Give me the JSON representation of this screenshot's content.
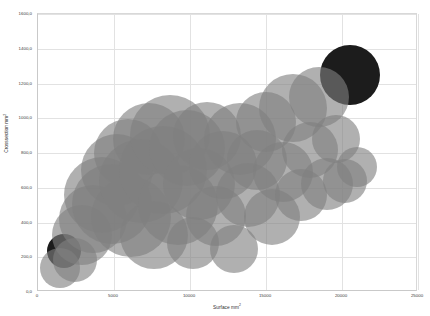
{
  "chart_data": {
    "type": "scatter",
    "variant": "bubble",
    "title": "",
    "xlabel": "Surface mm²",
    "ylabel": "Crosssection mm²",
    "xlim": [
      0,
      25000
    ],
    "ylim": [
      0,
      1600
    ],
    "xticks": [
      0,
      5000,
      10000,
      15000,
      20000,
      25000
    ],
    "xtick_labels": [
      "0",
      "5000",
      "10000",
      "15000",
      "20000",
      "25000"
    ],
    "yticks": [
      0,
      200,
      400,
      600,
      800,
      1000,
      1200,
      1400,
      1600
    ],
    "ytick_labels": [
      "0,0",
      "200,0",
      "400,0",
      "600,0",
      "800,0",
      "1000,0",
      "1200,0",
      "1400,0",
      "1600,0"
    ],
    "grid": true,
    "legend": "none",
    "bubble_color": "#808080",
    "bubble_opacity": 0.62,
    "highlight_color": "#1c1c1c",
    "background": "#ffffff",
    "grid_color": "#e2e2e2",
    "points": [
      {
        "x": 1700,
        "y": 235,
        "r": 17,
        "highlight": true
      },
      {
        "x": 20500,
        "y": 1250,
        "r": 30,
        "highlight": true
      },
      {
        "x": 1450,
        "y": 140,
        "r": 20,
        "highlight": false
      },
      {
        "x": 2450,
        "y": 185,
        "r": 22,
        "highlight": false
      },
      {
        "x": 2900,
        "y": 330,
        "r": 30,
        "highlight": false
      },
      {
        "x": 3600,
        "y": 420,
        "r": 34,
        "highlight": false
      },
      {
        "x": 4200,
        "y": 560,
        "r": 38,
        "highlight": false
      },
      {
        "x": 4900,
        "y": 505,
        "r": 40,
        "highlight": false
      },
      {
        "x": 5200,
        "y": 700,
        "r": 36,
        "highlight": false
      },
      {
        "x": 5900,
        "y": 800,
        "r": 34,
        "highlight": false
      },
      {
        "x": 6100,
        "y": 430,
        "r": 40,
        "highlight": false
      },
      {
        "x": 6800,
        "y": 640,
        "r": 42,
        "highlight": false
      },
      {
        "x": 7300,
        "y": 880,
        "r": 36,
        "highlight": false
      },
      {
        "x": 7600,
        "y": 330,
        "r": 34,
        "highlight": false
      },
      {
        "x": 8200,
        "y": 700,
        "r": 44,
        "highlight": false
      },
      {
        "x": 8700,
        "y": 905,
        "r": 40,
        "highlight": false
      },
      {
        "x": 9200,
        "y": 500,
        "r": 40,
        "highlight": false
      },
      {
        "x": 9800,
        "y": 830,
        "r": 38,
        "highlight": false
      },
      {
        "x": 10200,
        "y": 280,
        "r": 26,
        "highlight": false
      },
      {
        "x": 10600,
        "y": 620,
        "r": 36,
        "highlight": false
      },
      {
        "x": 11100,
        "y": 900,
        "r": 34,
        "highlight": false
      },
      {
        "x": 11700,
        "y": 440,
        "r": 30,
        "highlight": false
      },
      {
        "x": 12200,
        "y": 730,
        "r": 34,
        "highlight": false
      },
      {
        "x": 12900,
        "y": 250,
        "r": 24,
        "highlight": false
      },
      {
        "x": 13300,
        "y": 880,
        "r": 36,
        "highlight": false
      },
      {
        "x": 13800,
        "y": 560,
        "r": 32,
        "highlight": false
      },
      {
        "x": 14400,
        "y": 760,
        "r": 30,
        "highlight": false
      },
      {
        "x": 15000,
        "y": 980,
        "r": 30,
        "highlight": false
      },
      {
        "x": 15400,
        "y": 430,
        "r": 28,
        "highlight": false
      },
      {
        "x": 16100,
        "y": 690,
        "r": 30,
        "highlight": false
      },
      {
        "x": 16800,
        "y": 1060,
        "r": 34,
        "highlight": false
      },
      {
        "x": 17300,
        "y": 560,
        "r": 26,
        "highlight": false
      },
      {
        "x": 17900,
        "y": 820,
        "r": 28,
        "highlight": false
      },
      {
        "x": 18500,
        "y": 1120,
        "r": 30,
        "highlight": false
      },
      {
        "x": 19000,
        "y": 620,
        "r": 26,
        "highlight": false
      },
      {
        "x": 19600,
        "y": 880,
        "r": 24,
        "highlight": false
      },
      {
        "x": 20200,
        "y": 640,
        "r": 22,
        "highlight": false
      },
      {
        "x": 21000,
        "y": 720,
        "r": 20,
        "highlight": false
      }
    ]
  }
}
